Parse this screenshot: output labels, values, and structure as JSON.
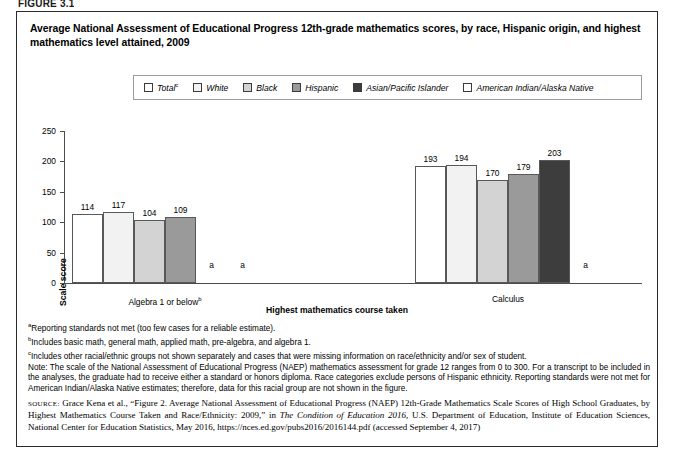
{
  "figure_label": "FIGURE 3.1",
  "title": "Average National Assessment of Educational Progress 12th-grade mathematics scores, by race, Hispanic origin, and highest mathematics level attained, 2009",
  "legend": {
    "items": [
      {
        "label": "Total",
        "marker": "c",
        "color": "#ffffff"
      },
      {
        "label": "White",
        "marker": "",
        "color": "#f2f2f2"
      },
      {
        "label": "Black",
        "marker": "",
        "color": "#d3d3d3"
      },
      {
        "label": "Hispanic",
        "marker": "",
        "color": "#9a9a9a"
      },
      {
        "label": "Asian/Pacific Islander",
        "marker": "",
        "color": "#3d3d3d"
      },
      {
        "label": "American Indian/Alaska Native",
        "marker": "",
        "color": "#ffffff"
      }
    ]
  },
  "chart_data": {
    "type": "bar",
    "title": "Average National Assessment of Educational Progress 12th-grade mathematics scores, by race, Hispanic origin, and highest mathematics level attained, 2009",
    "xlabel": "Highest mathematics course taken",
    "ylabel": "Scale score",
    "ylim": [
      0,
      250
    ],
    "yticks": [
      0,
      50,
      100,
      150,
      200,
      250
    ],
    "grid": false,
    "legend_position": "top",
    "categories": [
      "Algebra 1 or below",
      "Calculus"
    ],
    "category_markers": [
      "b",
      ""
    ],
    "series": [
      {
        "name": "Total",
        "values": [
          114,
          193
        ]
      },
      {
        "name": "White",
        "values": [
          117,
          194
        ]
      },
      {
        "name": "Black",
        "values": [
          104,
          170
        ]
      },
      {
        "name": "Hispanic",
        "values": [
          109,
          179
        ]
      },
      {
        "name": "Asian/Pacific Islander",
        "values": [
          null,
          203
        ]
      },
      {
        "name": "American Indian/Alaska Native",
        "values": [
          null,
          null
        ]
      }
    ],
    "suppressed_label": "a",
    "annotations": [
      {
        "category": "Algebra 1 or below",
        "series": "Asian/Pacific Islander",
        "text": "a"
      },
      {
        "category": "Algebra 1 or below",
        "series": "American Indian/Alaska Native",
        "text": "a"
      },
      {
        "category": "Calculus",
        "series": "American Indian/Alaska Native",
        "text": "a"
      }
    ]
  },
  "footnotes": [
    {
      "marker": "a",
      "text": "Reporting standards not met (too few cases for a reliable estimate)."
    },
    {
      "marker": "b",
      "text": "Includes basic math, general math, applied math, pre-algebra, and algebra 1."
    },
    {
      "marker": "c",
      "text": "Includes other racial/ethnic groups not shown separately and cases that were missing information on race/ethnicity and/or sex of student."
    }
  ],
  "note": "Note: The scale of the National Assessment of Educational Progress (NAEP) mathematics assessment for grade 12 ranges from 0 to 300. For a transcript to be included in the analyses, the graduate had to receive either a standard or honors diploma. Race categories exclude persons of Hispanic ethnicity. Reporting standards were not met for American Indian/Alaska Native estimates; therefore, data for this racial group are not shown in the figure.",
  "source": {
    "kicker": "SOURCE:",
    "part1": " Grace Kena et al., “Figure 2. Average National Assessment of Educational Progress (NAEP) 12th-Grade Mathematics Scale Scores of High School Graduates, by Highest Mathematics Course Taken and Race/Ethnicity: 2009,” in ",
    "italic": "The Condition of Education 2016",
    "part2": ", U.S. Department of Education, Institute of Education Sciences, National Center for Education Statistics, May 2016, https://nces.ed.gov/pubs2016/2016144.pdf (accessed September 4, 2017)"
  }
}
